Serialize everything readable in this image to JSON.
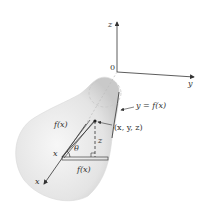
{
  "diagram": {
    "type": "surface-of-revolution",
    "axes": {
      "z_label": "z",
      "y_label": "y",
      "x_label": "x",
      "origin_label": "0"
    },
    "curve_label": "y = f(x)",
    "point_label": "(x, y, z)",
    "radius_label_slant": "f(x)",
    "radius_label_base": "f(x)",
    "height_label": "z",
    "angle_label": "θ",
    "x_position_label": "x",
    "colors": {
      "surface_light": "#f4f4f4",
      "surface_dark": "#cfcfcf",
      "lines": "#333333"
    }
  }
}
